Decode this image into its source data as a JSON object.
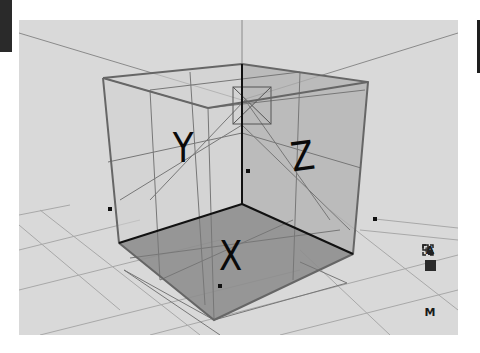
{
  "viewport": {
    "background": "#d9d9d9",
    "axis_labels": {
      "x": "X",
      "y": "Y",
      "z": "Z"
    }
  },
  "toolbar": {
    "items": [
      {
        "icon": "text-a-icon",
        "label": "A"
      },
      {
        "icon": "solid-square-icon",
        "label": ""
      },
      {
        "icon": "linked-boxes-icon",
        "label": ""
      },
      {
        "icon": "focus-frame-icon",
        "label": ""
      },
      {
        "icon": "material-m-icon",
        "label": "M"
      }
    ]
  }
}
